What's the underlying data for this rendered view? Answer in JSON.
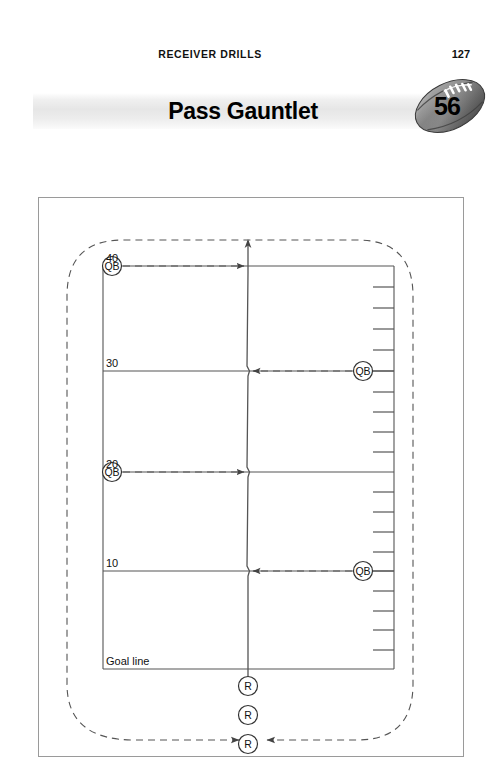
{
  "header": {
    "running_title": "RECEIVER DRILLS",
    "page_number": "127"
  },
  "banner": {
    "drill_title": "Pass Gauntlet",
    "drill_number": "56"
  },
  "diagram": {
    "name": "pass-gauntlet-field-diagram",
    "yard_lines": [
      {
        "label": "40",
        "y": 68
      },
      {
        "label": "30",
        "y": 173
      },
      {
        "label": "20",
        "y": 274
      },
      {
        "label": "10",
        "y": 373
      },
      {
        "label": "Goal line",
        "y": 471
      }
    ],
    "goal_line_label": "Goal line",
    "quarterbacks": [
      {
        "label": "QB",
        "side": "left",
        "yard": "40",
        "x": 73,
        "y": 68
      },
      {
        "label": "QB",
        "side": "right",
        "yard": "30",
        "x": 324,
        "y": 173
      },
      {
        "label": "QB",
        "side": "left",
        "yard": "20",
        "x": 73,
        "y": 274
      },
      {
        "label": "QB",
        "side": "right",
        "yard": "10",
        "x": 324,
        "y": 373
      }
    ],
    "receivers": [
      {
        "label": "R",
        "x": 209,
        "y": 488
      },
      {
        "label": "R",
        "x": 209,
        "y": 517
      },
      {
        "label": "R",
        "x": 209,
        "y": 546
      }
    ],
    "route_label": "receiver-run-route",
    "pass_label": "pass-arrow",
    "return_label": "return-loop-path"
  },
  "colors": {
    "field_line": "#555555",
    "frame_border": "#9a9a9a",
    "dashed_path": "#555555",
    "text": "#111111",
    "banner_light": "#f2f2f2",
    "football_dark": "#4a4a4a",
    "football_light": "#b4b4b4"
  }
}
